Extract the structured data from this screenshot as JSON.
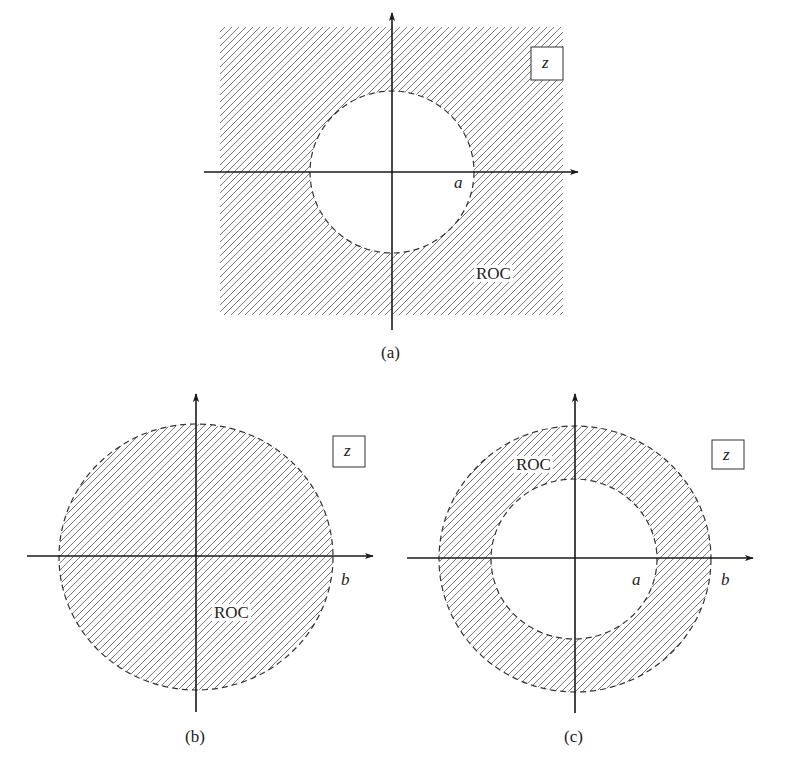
{
  "figure": {
    "panels": [
      {
        "id": "a",
        "caption": "(a)",
        "plane_label": "z",
        "roc_label": "ROC",
        "radius_labels": [
          "a"
        ],
        "roc_type": "exterior of circle |z| > a"
      },
      {
        "id": "b",
        "caption": "(b)",
        "plane_label": "z",
        "roc_label": "ROC",
        "radius_labels": [
          "b"
        ],
        "roc_type": "interior of circle |z| < b"
      },
      {
        "id": "c",
        "caption": "(c)",
        "plane_label": "z",
        "roc_label": "ROC",
        "radius_labels": [
          "a",
          "b"
        ],
        "roc_type": "annulus a < |z| < b"
      }
    ]
  },
  "colors": {
    "axis": "#1a1a1a",
    "hatch": "#7a7a7a",
    "boundary": "#333333",
    "text": "#222222"
  }
}
